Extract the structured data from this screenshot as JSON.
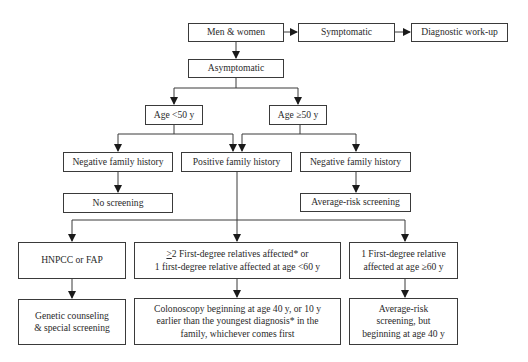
{
  "diagram": {
    "nodes": {
      "men_women": "Men & women",
      "symptomatic": "Symptomatic",
      "diagnostic_workup": "Diagnostic work-up",
      "asymptomatic": "Asymptomatic",
      "age_lt50": "Age <50 y",
      "age_ge50": "Age ≥50 y",
      "neg_family_left": "Negative family history",
      "pos_family": "Positive family history",
      "neg_family_right": "Negative family history",
      "no_screening": "No screening",
      "avg_risk_screening": "Average-risk screening",
      "hnpcc_fap": "HNPCC or FAP",
      "multi_relatives": {
        "line1_prefix": ">",
        "line1_rest": "2 First-degree relatives affected* or",
        "line2": "1 first-degree relative affected at age <60 y"
      },
      "one_relative": {
        "line1": "1 First-degree relative",
        "line2": "affected at age ≥60 y"
      },
      "genetic_counseling": {
        "line1": "Genetic counseling",
        "line2": "& special screening"
      },
      "colonoscopy": {
        "line1": "Colonoscopy beginning at age 40 y, or 10 y",
        "line2": "earlier than the youngest diagnosis* in the",
        "line3": "family, whichever comes first"
      },
      "avg_risk_40": {
        "line1": "Average-risk",
        "line2": "screening, but",
        "line3": "beginning at age 40 y"
      }
    },
    "edges": [
      [
        "men_women",
        "symptomatic"
      ],
      [
        "symptomatic",
        "diagnostic_workup"
      ],
      [
        "men_women",
        "asymptomatic"
      ],
      [
        "asymptomatic",
        "age_lt50"
      ],
      [
        "asymptomatic",
        "age_ge50"
      ],
      [
        "age_lt50",
        "neg_family_left"
      ],
      [
        "age_lt50",
        "pos_family"
      ],
      [
        "age_ge50",
        "pos_family"
      ],
      [
        "age_ge50",
        "neg_family_right"
      ],
      [
        "neg_family_left",
        "no_screening"
      ],
      [
        "neg_family_right",
        "avg_risk_screening"
      ],
      [
        "pos_family",
        "hnpcc_fap"
      ],
      [
        "pos_family",
        "multi_relatives"
      ],
      [
        "pos_family",
        "one_relative"
      ],
      [
        "hnpcc_fap",
        "genetic_counseling"
      ],
      [
        "multi_relatives",
        "colonoscopy"
      ],
      [
        "one_relative",
        "avg_risk_40"
      ]
    ],
    "colors": {
      "stroke": "#3a3a3a",
      "text": "#2a2a2a",
      "background": "#ffffff"
    }
  }
}
